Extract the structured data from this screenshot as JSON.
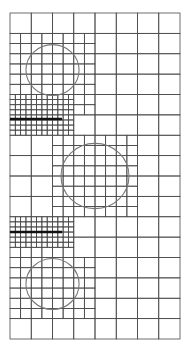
{
  "diagram": {
    "type": "adaptive-quadtree-mesh",
    "domain": {
      "cols": 8,
      "rows": 16
    },
    "max_refinement_level": 2,
    "colors": {
      "mesh_line": "#4a4a4a",
      "inclusion": "#777777",
      "crack": "#111111",
      "background": "#ffffff"
    },
    "inclusions": [
      {
        "name": "inclusion-top",
        "cx": 2.0,
        "cy": 2.8,
        "r": 1.25
      },
      {
        "name": "inclusion-middle",
        "cx": 4.0,
        "cy": 8.0,
        "r": 1.6
      },
      {
        "name": "inclusion-bottom",
        "cx": 2.0,
        "cy": 13.3,
        "r": 1.25
      }
    ],
    "cracks": [
      {
        "name": "crack-upper",
        "x1": 0.0,
        "x2": 2.45,
        "y": 5.2
      },
      {
        "name": "crack-lower",
        "x1": 0.0,
        "x2": 2.45,
        "y": 10.75
      }
    ]
  }
}
